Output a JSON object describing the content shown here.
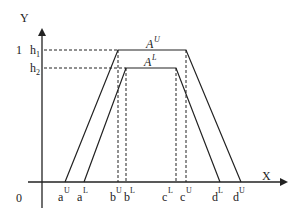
{
  "diagram": {
    "axes": {
      "y_label": "Y",
      "x_label": "X",
      "origin_label": "0",
      "one_label": "1"
    },
    "heights": {
      "h1": {
        "base": "h",
        "sub": "1"
      },
      "h2": {
        "base": "h",
        "sub": "2"
      }
    },
    "sets": {
      "upper": {
        "base": "A",
        "sup": "U"
      },
      "lower": {
        "base": "A",
        "sup": "L"
      }
    },
    "x_points": [
      {
        "base": "a",
        "sup": "U"
      },
      {
        "base": "a",
        "sup": "L"
      },
      {
        "base": "b",
        "sup": "U"
      },
      {
        "base": "b",
        "sup": "L"
      },
      {
        "base": "c",
        "sup": "L"
      },
      {
        "base": "c",
        "sup": "U"
      },
      {
        "base": "d",
        "sup": "L"
      },
      {
        "base": "d",
        "sup": "U"
      }
    ],
    "line_color": "#222222"
  }
}
